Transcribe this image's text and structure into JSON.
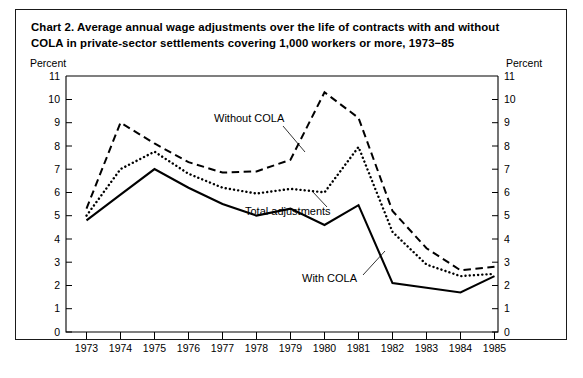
{
  "figure": {
    "title_line1": "Chart 2.   Average annual wage adjustments over the life of contracts with and without",
    "title_line2": "COLA in private-sector settlements covering 1,000 workers or more, 1973−85",
    "axis_unit_left": "Percent",
    "axis_unit_right": "Percent"
  },
  "chart_data": {
    "type": "line",
    "title": "Chart 2.   Average annual wage adjustments over the life of contracts with and without COLA in private-sector settlements covering 1,000 workers or more, 1973−85",
    "xlabel": "",
    "ylabel": "Percent",
    "ylim": [
      0,
      11
    ],
    "xlim": [
      1973,
      1985
    ],
    "grid": false,
    "legend_position": "inline-annotations",
    "categories": [
      1973,
      1974,
      1975,
      1976,
      1977,
      1978,
      1979,
      1980,
      1981,
      1982,
      1983,
      1984,
      1985
    ],
    "xticklabels": [
      "1973",
      "1974",
      "1975",
      "1976",
      "1977",
      "1978",
      "1979",
      "1980",
      "1981",
      "1982",
      "1983",
      "1984",
      "1985"
    ],
    "yticklabels": [
      "0",
      "1",
      "2",
      "3",
      "4",
      "5",
      "6",
      "7",
      "8",
      "9",
      "10",
      "11"
    ],
    "series": [
      {
        "name": "Without COLA",
        "style": "dashed",
        "values": [
          5.3,
          9.0,
          8.1,
          7.3,
          6.85,
          6.9,
          7.4,
          10.3,
          9.2,
          5.2,
          3.6,
          2.65,
          2.8
        ]
      },
      {
        "name": "Total adjustments",
        "style": "dotted",
        "values": [
          5.0,
          7.0,
          7.75,
          6.8,
          6.2,
          5.95,
          6.15,
          6.0,
          7.95,
          4.3,
          2.9,
          2.4,
          2.5
        ]
      },
      {
        "name": "With COLA",
        "style": "solid",
        "values": [
          4.8,
          5.9,
          7.0,
          6.2,
          5.5,
          5.0,
          5.3,
          4.6,
          5.45,
          2.1,
          1.9,
          1.7,
          2.4
        ]
      }
    ],
    "annotations": [
      {
        "text": "Without COLA",
        "points_to": "Without COLA"
      },
      {
        "text": "Total adjustments",
        "points_to": "Total adjustments"
      },
      {
        "text": "With COLA",
        "points_to": "With COLA"
      }
    ]
  }
}
